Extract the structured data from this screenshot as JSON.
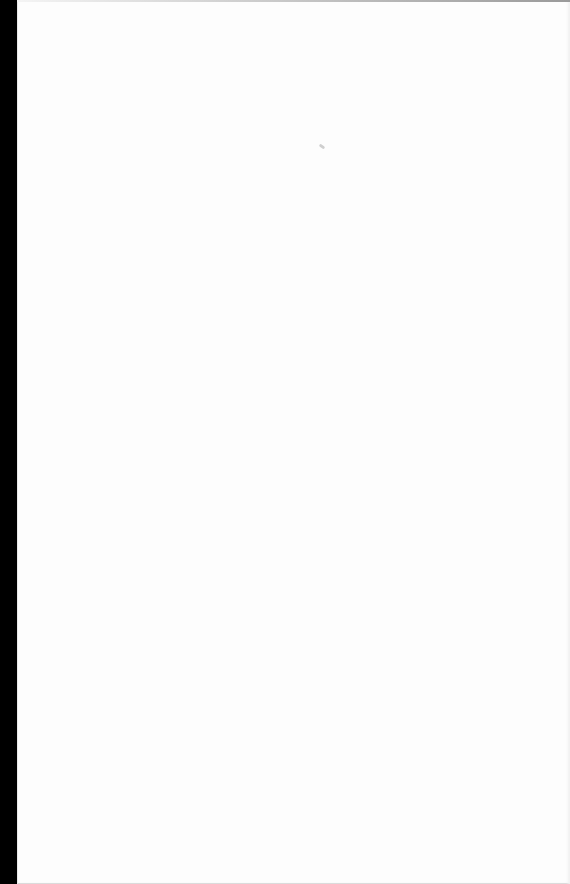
{
  "document": {
    "type": "blank-scanned-page",
    "text": ""
  },
  "colors": {
    "page_background": "#fdfdfd",
    "edge_strip": "#000000"
  }
}
